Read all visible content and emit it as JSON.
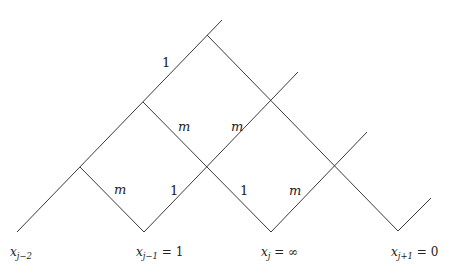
{
  "diagram": {
    "stroke_color": "#3a3a3a",
    "edges": [
      {
        "id": "main-diagonal",
        "points": [
          [
            17,
            232
          ],
          [
            222,
            20
          ]
        ]
      },
      {
        "id": "branch-A",
        "points": [
          [
            80,
            167
          ],
          [
            144,
            232
          ],
          [
            298,
            72
          ]
        ]
      },
      {
        "id": "branch-B",
        "points": [
          [
            143,
            102
          ],
          [
            271,
            232
          ],
          [
            367,
            132
          ]
        ]
      },
      {
        "id": "branch-top",
        "points": [
          [
            207,
            35
          ],
          [
            398,
            231
          ],
          [
            431,
            198
          ]
        ]
      }
    ],
    "edge_labels": [
      {
        "text": "1",
        "x": 162,
        "y": 67,
        "style": "num"
      },
      {
        "text": "m",
        "x": 178,
        "y": 131,
        "style": "m"
      },
      {
        "text": "m",
        "x": 231,
        "y": 131,
        "style": "m"
      },
      {
        "text": "m",
        "x": 114,
        "y": 194,
        "style": "m"
      },
      {
        "text": "1",
        "x": 170,
        "y": 195,
        "style": "num"
      },
      {
        "text": "1",
        "x": 240,
        "y": 195,
        "style": "num"
      },
      {
        "text": "m",
        "x": 289,
        "y": 195,
        "style": "m"
      }
    ],
    "axis_labels": [
      {
        "var": "x",
        "sub": "j−2",
        "rhs": "",
        "x": 10,
        "y": 256
      },
      {
        "var": "x",
        "sub": "j−1",
        "rhs": " = 1",
        "x": 136,
        "y": 256
      },
      {
        "var": "x",
        "sub": "j",
        "rhs": " = ∞",
        "x": 261,
        "y": 256
      },
      {
        "var": "x",
        "sub": "j+1",
        "rhs": " = 0",
        "x": 391,
        "y": 256
      }
    ]
  }
}
